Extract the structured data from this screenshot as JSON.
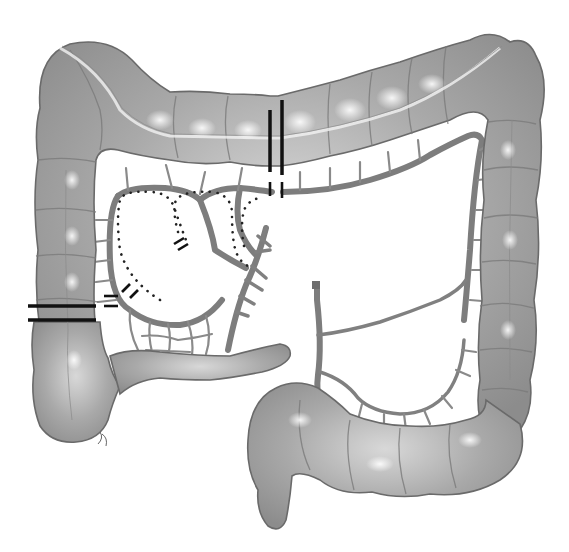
{
  "diagram": {
    "colors": {
      "background": "#ffffff",
      "bowel_fill": "#a8a8a8",
      "bowel_outline": "#6a6a6a",
      "vessel": "#7d7d7d",
      "resection_line": "#111111",
      "ligation_dots": "#222222"
    },
    "segments": [
      {
        "name": "ascending-colon"
      },
      {
        "name": "transverse-colon"
      },
      {
        "name": "descending-colon"
      },
      {
        "name": "sigmoid-colon"
      },
      {
        "name": "cecum"
      },
      {
        "name": "terminal-ileum"
      },
      {
        "name": "appendix"
      }
    ],
    "markers": [
      {
        "name": "resection-line-transverse",
        "orientation": "vertical"
      },
      {
        "name": "resection-line-ileum",
        "orientation": "horizontal"
      },
      {
        "name": "vessel-ligation-ileocolic"
      },
      {
        "name": "vessel-ligation-right-colic"
      },
      {
        "name": "vessel-ligation-middle-colic"
      },
      {
        "name": "dotted-resection-boundary"
      }
    ]
  }
}
